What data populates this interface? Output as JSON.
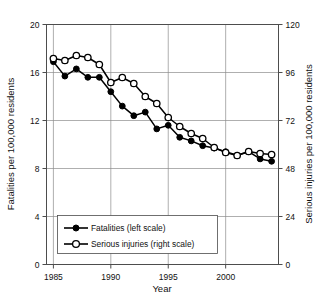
{
  "chart_data": {
    "type": "line",
    "title": "",
    "xlabel": "Year",
    "ylabel": "Fatalities per 100,000 residents",
    "y2label": "Serious injuries per 100,000 residents",
    "x": [
      1985,
      1986,
      1987,
      1988,
      1989,
      1990,
      1991,
      1992,
      1993,
      1994,
      1995,
      1996,
      1997,
      1998,
      1999,
      2000,
      2001,
      2002,
      2003,
      2004
    ],
    "xlim": [
      1984.4,
      2004.6
    ],
    "ylim": [
      0,
      20
    ],
    "y2lim": [
      0,
      120
    ],
    "xticks": [
      1985,
      1990,
      1995,
      2000
    ],
    "xtick_labels": [
      "1985",
      "1990",
      "1995",
      "2000"
    ],
    "yticks": [
      0,
      4,
      8,
      12,
      16,
      20
    ],
    "ytick_labels": [
      "0",
      "4",
      "8",
      "12",
      "16",
      "20"
    ],
    "y2ticks": [
      0,
      24,
      48,
      72,
      96,
      120
    ],
    "y2tick_labels": [
      "0",
      "24",
      "48",
      "72",
      "96",
      "120"
    ],
    "grid": true,
    "legend_position": "lower-left-inside",
    "series": [
      {
        "name": "Fatalities (left scale)",
        "axis": "left",
        "marker": "filled-circle",
        "values": [
          16.9,
          15.7,
          16.3,
          15.6,
          15.6,
          14.4,
          13.2,
          12.4,
          12.7,
          11.3,
          11.6,
          10.6,
          10.3,
          9.9,
          9.7,
          9.4,
          9.1,
          9.4,
          8.8,
          8.6
        ]
      },
      {
        "name": "Serious injuries (right scale)",
        "axis": "right",
        "marker": "open-circle",
        "values": [
          103.0,
          102.0,
          104.5,
          103.5,
          100.0,
          91.0,
          93.5,
          90.5,
          84.0,
          80.5,
          73.5,
          69.0,
          65.5,
          63.0,
          58.5,
          56.0,
          54.5,
          56.5,
          55.5,
          55.0
        ]
      }
    ]
  },
  "legend": {
    "items": [
      {
        "label": "Fatalities (left scale)",
        "marker": "filled-circle"
      },
      {
        "label": "Serious injuries (right scale)",
        "marker": "open-circle"
      }
    ]
  },
  "colors": {
    "series": "#000000",
    "grid": "#8c8c8c",
    "frame": "#4d4d4d",
    "background": "#ffffff"
  }
}
